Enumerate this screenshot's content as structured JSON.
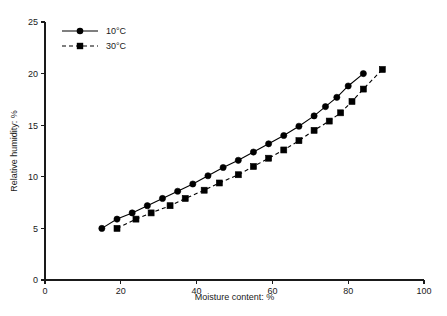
{
  "chart_data": {
    "type": "line",
    "title": "",
    "xlabel": "Moisture content: %",
    "ylabel": "Relative humidity: %",
    "xlim": [
      0,
      100
    ],
    "ylim": [
      0,
      25
    ],
    "xticks": [
      0,
      20,
      40,
      60,
      80,
      100
    ],
    "yticks": [
      0,
      5,
      10,
      15,
      20,
      25
    ],
    "grid": false,
    "legend_position": "top-left-inside",
    "series": [
      {
        "name": "10°C",
        "marker": "circle",
        "linestyle": "solid",
        "color": "#000000",
        "points": [
          [
            15,
            5.0
          ],
          [
            19,
            5.9
          ],
          [
            23,
            6.5
          ],
          [
            27,
            7.2
          ],
          [
            31,
            7.9
          ],
          [
            35,
            8.6
          ],
          [
            39,
            9.3
          ],
          [
            43,
            10.1
          ],
          [
            47,
            10.9
          ],
          [
            51,
            11.6
          ],
          [
            55,
            12.4
          ],
          [
            59,
            13.2
          ],
          [
            63,
            14.0
          ],
          [
            67,
            14.9
          ],
          [
            71,
            15.9
          ],
          [
            74,
            16.8
          ],
          [
            77,
            17.7
          ],
          [
            80,
            18.8
          ],
          [
            84,
            20.0
          ]
        ]
      },
      {
        "name": "30°C",
        "marker": "square",
        "linestyle": "dashed",
        "color": "#000000",
        "points": [
          [
            19,
            5.0
          ],
          [
            24,
            5.9
          ],
          [
            28,
            6.5
          ],
          [
            33,
            7.2
          ],
          [
            37,
            7.9
          ],
          [
            42,
            8.7
          ],
          [
            46,
            9.4
          ],
          [
            51,
            10.2
          ],
          [
            55,
            11.0
          ],
          [
            59,
            11.8
          ],
          [
            63,
            12.6
          ],
          [
            67,
            13.5
          ],
          [
            71,
            14.5
          ],
          [
            75,
            15.4
          ],
          [
            78,
            16.2
          ],
          [
            81,
            17.3
          ],
          [
            84,
            18.5
          ],
          [
            89,
            20.4
          ]
        ]
      }
    ]
  },
  "legend": {
    "entries": [
      {
        "label": "10°C",
        "marker": "circle",
        "linestyle": "solid"
      },
      {
        "label": "30°C",
        "marker": "square",
        "linestyle": "dashed"
      }
    ]
  }
}
